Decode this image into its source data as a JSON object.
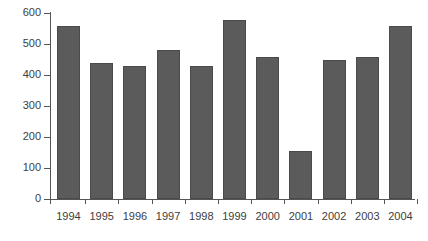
{
  "chart_data": {
    "type": "bar",
    "title": "",
    "subtitle": "",
    "xlabel": "",
    "ylabel": "",
    "categories": [
      "1994",
      "1995",
      "1996",
      "1997",
      "1998",
      "1999",
      "2000",
      "2001",
      "2002",
      "2003",
      "2004"
    ],
    "values": [
      558,
      440,
      430,
      480,
      430,
      578,
      458,
      155,
      448,
      458,
      558
    ],
    "ylim": [
      0,
      600
    ],
    "y_ticks": [
      0,
      100,
      200,
      300,
      400,
      500,
      600
    ],
    "y_tick_labels": [
      "0",
      "100",
      "200",
      "300",
      "400",
      "500",
      "600"
    ],
    "grid": false,
    "legend": null,
    "legend_position": "none",
    "series": [
      {
        "name": "",
        "values": [
          558,
          440,
          430,
          480,
          430,
          578,
          458,
          155,
          448,
          458,
          558
        ]
      }
    ],
    "colors": {
      "bar_fill": "#5b5b5b",
      "bar_border": "#4a4a4a",
      "axis": "#555555",
      "text": "#3d3d3d",
      "background": "#ffffff"
    }
  }
}
